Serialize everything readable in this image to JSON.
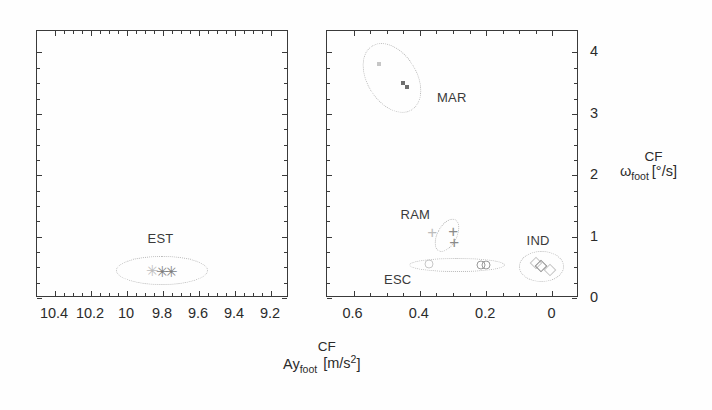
{
  "figure": {
    "background": "#ffffff",
    "axis_color": "#3a3a3a",
    "marker_color": "#8e8e8e",
    "ellipse_color": "#b9b9b9"
  },
  "axes": {
    "x_title_main": "Ay",
    "x_title_sub": "foot",
    "x_title_sup": "CF",
    "x_title_units": "[m/s",
    "x_title_units_exp": "2",
    "x_title_units_close": "]",
    "y_title_main": "ω",
    "y_title_sub": "foot",
    "y_title_sup": "CF",
    "y_title_units": "[°/s]"
  },
  "chart_data": {
    "type": "scatter",
    "title": "",
    "xlabel": "Ay_foot^CF [m/s^2]",
    "ylabel": "omega_foot^CF [deg/s]",
    "grid": false,
    "legend": "none",
    "panels": [
      {
        "name": "left-panel",
        "xlim": [
          10.5,
          9.1
        ],
        "ylim": [
          0,
          4.35
        ],
        "x_inverted": true,
        "xticks": [
          10.4,
          10.2,
          10,
          9.8,
          9.6,
          9.4,
          9.2
        ],
        "xticklabels": [
          "10.4",
          "10.2",
          "10",
          "9.8",
          "9.6",
          "9.4",
          "9.2"
        ],
        "yticks": [],
        "yticklabels": [],
        "clusters": [
          {
            "label": "EST",
            "marker": "asterisk",
            "label_x": 9.88,
            "label_y": 0.95,
            "ellipse": {
              "cx": 9.8,
              "cy": 0.43,
              "rx": 0.255,
              "ry": 0.235,
              "rotation": 0
            },
            "points": [
              {
                "x": 9.855,
                "y": 0.44,
                "faint": true
              },
              {
                "x": 9.795,
                "y": 0.42,
                "faint": false
              },
              {
                "x": 9.745,
                "y": 0.42,
                "faint": false
              }
            ]
          }
        ]
      },
      {
        "name": "right-panel",
        "xlim": [
          0.68,
          -0.08
        ],
        "ylim": [
          0,
          4.35
        ],
        "x_inverted": true,
        "xticks": [
          0.6,
          0.4,
          0.2,
          0
        ],
        "xticklabels": [
          "0.6",
          "0.4",
          "0.2",
          "0"
        ],
        "yticks": [
          0,
          1,
          2,
          3,
          4
        ],
        "yticklabels": [
          "0",
          "1",
          "2",
          "3",
          "4"
        ],
        "clusters": [
          {
            "label": "MAR",
            "marker": "dot",
            "label_x": 0.345,
            "label_y": 3.24,
            "ellipse": {
              "cx": 0.48,
              "cy": 3.57,
              "rx": 0.075,
              "ry": 0.62,
              "rotation": -32
            },
            "points": [
              {
                "x": 0.52,
                "y": 3.79,
                "faint": true
              },
              {
                "x": 0.448,
                "y": 3.48,
                "faint": false
              },
              {
                "x": 0.437,
                "y": 3.42,
                "faint": false
              }
            ]
          },
          {
            "label": "RAM",
            "marker": "plus",
            "label_x": 0.455,
            "label_y": 1.33,
            "ellipse": {
              "cx": 0.315,
              "cy": 1.0,
              "rx": 0.055,
              "ry": 0.165,
              "rotation": -62
            },
            "points": [
              {
                "x": 0.36,
                "y": 1.06,
                "faint": true
              },
              {
                "x": 0.296,
                "y": 1.07,
                "faint": false
              },
              {
                "x": 0.293,
                "y": 0.9,
                "faint": false
              }
            ]
          },
          {
            "label": "ESC",
            "marker": "circle",
            "label_x": 0.505,
            "label_y": 0.27,
            "ellipse": {
              "cx": 0.285,
              "cy": 0.52,
              "rx": 0.145,
              "ry": 0.115,
              "rotation": 0
            },
            "points": [
              {
                "x": 0.368,
                "y": 0.53,
                "faint": true
              },
              {
                "x": 0.212,
                "y": 0.52,
                "faint": false
              },
              {
                "x": 0.197,
                "y": 0.52,
                "faint": false
              }
            ]
          },
          {
            "label": "IND",
            "marker": "diamond",
            "label_x": 0.075,
            "label_y": 0.92,
            "ellipse": {
              "cx": 0.03,
              "cy": 0.5,
              "rx": 0.068,
              "ry": 0.25,
              "rotation": 0
            },
            "points": [
              {
                "x": 0.048,
                "y": 0.56,
                "faint": true
              },
              {
                "x": 0.032,
                "y": 0.51,
                "faint": false
              },
              {
                "x": 0.003,
                "y": 0.44,
                "faint": true
              }
            ]
          }
        ]
      }
    ]
  }
}
